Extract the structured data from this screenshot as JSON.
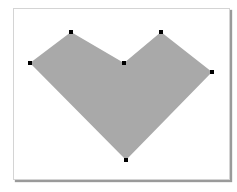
{
  "canvas": {
    "fill_color": "#a9a9a9",
    "handle_color": "#000000",
    "shape": "polygon",
    "vertices": [
      {
        "x": 71,
        "y": 32
      },
      {
        "x": 124,
        "y": 63
      },
      {
        "x": 161,
        "y": 32
      },
      {
        "x": 212,
        "y": 72
      },
      {
        "x": 126,
        "y": 160
      },
      {
        "x": 30,
        "y": 63
      }
    ]
  }
}
